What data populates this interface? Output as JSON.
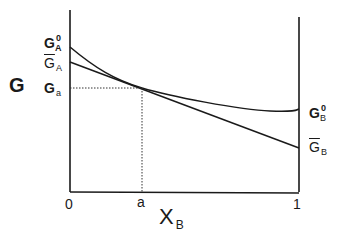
{
  "diagram": {
    "y_axis_label": "G",
    "x_axis_label": "X",
    "x_axis_label_subscript": "B",
    "x_ticks": [
      "0",
      "a",
      "1"
    ],
    "left_labels": [
      {
        "text": "G",
        "superscript": "0",
        "subscript": "A",
        "bold": true,
        "meaning": "pure A Gibbs energy"
      },
      {
        "text": "G",
        "subscript": "A",
        "overbar": true,
        "meaning": "partial molar Gibbs energy of A"
      },
      {
        "text": "G",
        "subscript": "a",
        "bold": true,
        "meaning": "Gibbs energy at composition a"
      }
    ],
    "right_labels": [
      {
        "text": "G",
        "superscript": "0",
        "subscript": "B",
        "bold": true,
        "meaning": "pure B Gibbs energy"
      },
      {
        "text": "G",
        "subscript": "B",
        "overbar": true,
        "meaning": "partial molar Gibbs energy of B"
      }
    ],
    "colors": {
      "line": "#1a1a1a",
      "background": "#ffffff"
    }
  },
  "labels": {
    "G_main": "G",
    "GA0_base": "G",
    "GA0_sup": "0",
    "GA0_sub": "A",
    "GAbar_base": "G",
    "GAbar_sub": "A",
    "Ga_base": "G",
    "Ga_sub": "a",
    "GB0_base": "G",
    "GB0_sup": "0",
    "GB0_sub": "B",
    "GBbar_base": "G",
    "GBbar_sub": "B",
    "tick_0": "0",
    "tick_a": "a",
    "tick_1": "1",
    "x_main": "X",
    "x_sub": "B"
  }
}
